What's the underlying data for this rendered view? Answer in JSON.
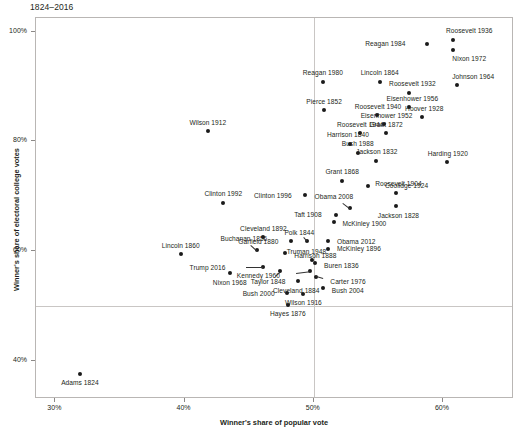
{
  "chart_data": {
    "type": "scatter",
    "title": "1824–2016",
    "xlabel": "Winner's share of popular vote",
    "ylabel": "Winner's share of electoral college votes",
    "xlim": [
      0.285,
      0.655
    ],
    "ylim": [
      0.33,
      1.025
    ],
    "xticks": [
      "30%",
      "40%",
      "50%",
      "60%"
    ],
    "xtick_values": [
      0.3,
      0.4,
      0.5,
      0.6
    ],
    "yticks": [
      "100%",
      "80%",
      "60%",
      "40%"
    ],
    "ytick_values": [
      1.0,
      0.8,
      0.6,
      0.4
    ],
    "grid": false,
    "legend": null,
    "reference_lines": [
      {
        "axis": "y",
        "value": 0.5
      },
      {
        "axis": "x",
        "value": 0.5
      }
    ],
    "marker_color": "#1a1a1a",
    "frame_color": "#b9b6b4",
    "points": [
      {
        "label": "Roosevelt 1936",
        "x": 0.608,
        "y": 0.985,
        "lx": 16,
        "ly": -9,
        "anchor": "center"
      },
      {
        "label": "Nixon 1972",
        "x": 0.608,
        "y": 0.967,
        "lx": 16,
        "ly": 9,
        "anchor": "center"
      },
      {
        "label": "Reagan 1984",
        "x": 0.588,
        "y": 0.978,
        "lx": -22,
        "ly": 0,
        "anchor": "right"
      },
      {
        "label": "Johnson 1964",
        "x": 0.611,
        "y": 0.902,
        "lx": 16,
        "ly": -9,
        "anchor": "center"
      },
      {
        "label": "Lincoln 1864",
        "x": 0.551,
        "y": 0.909,
        "lx": 0,
        "ly": -9,
        "anchor": "center"
      },
      {
        "label": "Reagan 1980",
        "x": 0.507,
        "y": 0.909,
        "lx": 0,
        "ly": -9,
        "anchor": "center"
      },
      {
        "label": "Roosevelt 1932",
        "x": 0.574,
        "y": 0.889,
        "lx": 3,
        "ly": -9,
        "anchor": "center"
      },
      {
        "label": "Eisenhower 1956",
        "x": 0.574,
        "y": 0.862,
        "lx": 3,
        "ly": -9,
        "anchor": "center"
      },
      {
        "label": "Pierce 1852",
        "x": 0.508,
        "y": 0.857,
        "lx": 0,
        "ly": -9,
        "anchor": "center"
      },
      {
        "label": "Hoover 1928",
        "x": 0.584,
        "y": 0.844,
        "lx": 2,
        "ly": -9,
        "anchor": "center"
      },
      {
        "label": "Roosevelt 1940",
        "x": 0.549,
        "y": 0.848,
        "lx": 1,
        "ly": -9,
        "anchor": "center"
      },
      {
        "label": "Eisenhower 1952",
        "x": 0.554,
        "y": 0.831,
        "lx": 3,
        "ly": -9,
        "anchor": "center"
      },
      {
        "label": "Roosevelt 1944",
        "x": 0.536,
        "y": 0.815,
        "lx": 0,
        "ly": -9,
        "anchor": "center"
      },
      {
        "label": "Grant 1872",
        "x": 0.556,
        "y": 0.815,
        "lx": 0,
        "ly": -9,
        "anchor": "center"
      },
      {
        "label": "Harrison 1840",
        "x": 0.528,
        "y": 0.796,
        "lx": -2,
        "ly": -9,
        "anchor": "center"
      },
      {
        "label": "Bush 1988",
        "x": 0.534,
        "y": 0.779,
        "lx": 0,
        "ly": -9,
        "anchor": "center"
      },
      {
        "label": "Jackson 1832",
        "x": 0.548,
        "y": 0.765,
        "lx": 1,
        "ly": -9,
        "anchor": "center"
      },
      {
        "label": "Harding 1920",
        "x": 0.603,
        "y": 0.762,
        "lx": 1,
        "ly": -9,
        "anchor": "center"
      },
      {
        "label": "Grant 1868",
        "x": 0.522,
        "y": 0.728,
        "lx": 0,
        "ly": -9,
        "anchor": "center"
      },
      {
        "label": "Coolidge 1924",
        "x": 0.542,
        "y": 0.719,
        "lx": 17,
        "ly": 0,
        "anchor": "left"
      },
      {
        "label": "Roosevelt 1904",
        "x": 0.564,
        "y": 0.706,
        "lx": 2,
        "ly": -9,
        "anchor": "center"
      },
      {
        "label": "Obama 2008",
        "x": 0.528,
        "y": 0.678,
        "lx": -16,
        "ly": -12,
        "anchor": "center",
        "leader": true
      },
      {
        "label": "Jackson 1828",
        "x": 0.564,
        "y": 0.682,
        "lx": 2,
        "ly": 9,
        "anchor": "center"
      },
      {
        "label": "Wilson 1912",
        "x": 0.418,
        "y": 0.818,
        "lx": 0,
        "ly": -9,
        "anchor": "center"
      },
      {
        "label": "Clinton 1992",
        "x": 0.43,
        "y": 0.688,
        "lx": 0,
        "ly": -9,
        "anchor": "center"
      },
      {
        "label": "Clinton 1996",
        "x": 0.493,
        "y": 0.703,
        "lx": -13,
        "ly": 1,
        "anchor": "right"
      },
      {
        "label": "Taft 1908",
        "x": 0.517,
        "y": 0.666,
        "lx": -14,
        "ly": 0,
        "anchor": "right"
      },
      {
        "label": "McKinley 1900",
        "x": 0.516,
        "y": 0.652,
        "lx": 8,
        "ly": 1,
        "anchor": "left"
      },
      {
        "label": "Cleveland 1892",
        "x": 0.461,
        "y": 0.625,
        "lx": 0,
        "ly": -9,
        "anchor": "center"
      },
      {
        "label": "Garfield 1880",
        "x": 0.482,
        "y": 0.618,
        "lx": -12,
        "ly": 0,
        "anchor": "right"
      },
      {
        "label": "Polk 1844",
        "x": 0.495,
        "y": 0.618,
        "lx": -8,
        "ly": -9,
        "anchor": "center",
        "leader": true
      },
      {
        "label": "Obama 2012",
        "x": 0.511,
        "y": 0.618,
        "lx": 9,
        "ly": 0,
        "anchor": "left"
      },
      {
        "label": "Buchanan 1856",
        "x": 0.456,
        "y": 0.601,
        "lx": -13,
        "ly": -12,
        "anchor": "center",
        "leader": true
      },
      {
        "label": "McKinley 1896",
        "x": 0.511,
        "y": 0.604,
        "lx": 9,
        "ly": 0,
        "anchor": "left"
      },
      {
        "label": "Harrison 1888",
        "x": 0.478,
        "y": 0.596,
        "lx": 9,
        "ly": 2,
        "anchor": "left"
      },
      {
        "label": "Lincoln 1860",
        "x": 0.397,
        "y": 0.594,
        "lx": 0,
        "ly": -9,
        "anchor": "center"
      },
      {
        "label": "Truman 1948",
        "x": 0.499,
        "y": 0.584,
        "lx": -6,
        "ly": -8,
        "anchor": "center"
      },
      {
        "label": "Trump 2016",
        "x": 0.461,
        "y": 0.57,
        "lx": -38,
        "ly": 0,
        "anchor": "right",
        "leader": true
      },
      {
        "label": "Buren 1836",
        "x": 0.501,
        "y": 0.578,
        "lx": 9,
        "ly": 2,
        "anchor": "left"
      },
      {
        "label": "Nixon 1968",
        "x": 0.435,
        "y": 0.559,
        "lx": 0,
        "ly": 9,
        "anchor": "center"
      },
      {
        "label": "Kennedy 1960",
        "x": 0.497,
        "y": 0.563,
        "lx": -30,
        "ly": 4,
        "anchor": "right",
        "leader": true
      },
      {
        "label": "Taylor 1848",
        "x": 0.474,
        "y": 0.563,
        "lx": -12,
        "ly": 10,
        "anchor": "center",
        "leader": true
      },
      {
        "label": "Cleveland 1884",
        "x": 0.488,
        "y": 0.545,
        "lx": -2,
        "ly": 9,
        "anchor": "center"
      },
      {
        "label": "Carter 1976",
        "x": 0.502,
        "y": 0.552,
        "lx": 14,
        "ly": 4,
        "anchor": "left",
        "leader": true
      },
      {
        "label": "Bush 2004",
        "x": 0.507,
        "y": 0.532,
        "lx": 9,
        "ly": 2,
        "anchor": "left"
      },
      {
        "label": "Bush 2000",
        "x": 0.479,
        "y": 0.524,
        "lx": -12,
        "ly": 1,
        "anchor": "right"
      },
      {
        "label": "Wilson 1916",
        "x": 0.492,
        "y": 0.522,
        "lx": 0,
        "ly": 9,
        "anchor": "center"
      },
      {
        "label": "Hayes 1876",
        "x": 0.48,
        "y": 0.502,
        "lx": 0,
        "ly": 9,
        "anchor": "center"
      },
      {
        "label": "Adams 1824",
        "x": 0.319,
        "y": 0.376,
        "lx": 0,
        "ly": 9,
        "anchor": "center"
      }
    ]
  }
}
